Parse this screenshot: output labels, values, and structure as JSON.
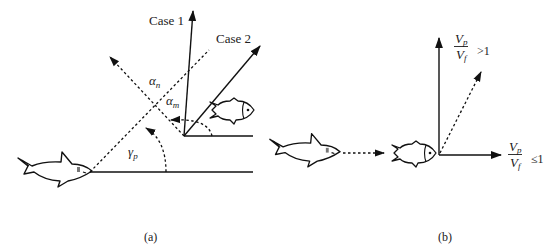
{
  "panel_a": {
    "caption": "(a)",
    "labels": {
      "case1": "Case 1",
      "case2": "Case 2",
      "alpha_n": {
        "symbol": "α",
        "sub": "n"
      },
      "alpha_m": {
        "symbol": "α",
        "sub": "m"
      },
      "gamma_p": {
        "symbol": "γ",
        "sub": "p"
      }
    },
    "elements": [
      "predator-shark",
      "prey-fish",
      "case1-velocity-arrow",
      "case2-velocity-arrow",
      "line-of-sight-dashed",
      "normal-dashed-arrow",
      "gamma-p-arc",
      "alpha-m-arc"
    ]
  },
  "panel_b": {
    "caption": "(b)",
    "labels": {
      "upper": {
        "num": "V",
        "num_sub": "p",
        "den": "V",
        "den_sub": "f",
        "cmp": ">1"
      },
      "right": {
        "num": "V",
        "num_sub": "p",
        "den": "V",
        "den_sub": "f",
        "cmp": "≤1"
      }
    },
    "elements": [
      "predator-shark",
      "pursuit-dashed-arrow",
      "prey-fish",
      "vertical-arrow",
      "horizontal-arrow",
      "diagonal-dashed-arrow"
    ]
  },
  "colors": {
    "stroke": "#1a1a1a",
    "background": "#ffffff"
  }
}
